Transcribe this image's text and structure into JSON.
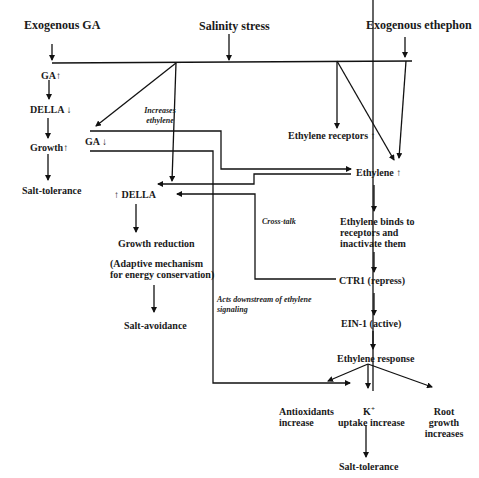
{
  "diagram": {
    "top_inputs": {
      "exogenous_ga": "Exogenous GA",
      "salinity_stress": "Salinity stress",
      "exogenous_ethephon": "Exogenous ethephon"
    },
    "left_branch": {
      "ga_up": "GA",
      "della_down": "DELLA",
      "growth_up": "Growth",
      "salt_tolerance": "Salt-tolerance"
    },
    "middle_branch": {
      "increases_ethylene_line1": "Increases",
      "increases_ethylene_line2": "ethylene",
      "ga_down": "GA",
      "della_up": "DELLA",
      "growth_reduction": "Growth reduction",
      "adaptive_line1": "(Adaptive mechanism",
      "adaptive_line2": "for energy conservation)",
      "salt_avoidance": "Salt-avoidance",
      "cross_talk": "Cross-talk",
      "acts_downstream_line1": "Acts downstream of ethylene",
      "acts_downstream_line2": "signaling"
    },
    "right_branch": {
      "ethylene_receptors_up": "Ethylene receptors",
      "ethylene_up": "Ethylene",
      "binds_line1": "Ethylene binds to",
      "binds_line2": "receptors and",
      "binds_line3": "inactivate them",
      "ctr1": "CTR1 (repress)",
      "ein1": "EIN-1 (active)",
      "ethylene_response": "Ethylene response"
    },
    "outcomes": {
      "antioxidants_line1": "Antioxidants",
      "antioxidants_line2": "increase",
      "k_symbol": "K",
      "k_superscript": "+",
      "k_line2": "uptake increase",
      "root_line1": "Root",
      "root_line2": "growth",
      "root_line3": "increases",
      "final_salt_tolerance": "Salt-tolerance"
    },
    "symbols": {
      "up_arrow": "↑",
      "down_arrow": "↓"
    }
  }
}
